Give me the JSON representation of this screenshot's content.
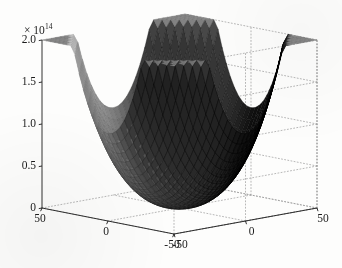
{
  "chart_data": {
    "type": "surface",
    "title": "",
    "xlabel": "",
    "ylabel": "",
    "zlabel": "",
    "exponent_label": "× 10",
    "exponent_value": "14",
    "z_scale": 100000000000000.0,
    "xlim": [
      -50,
      50
    ],
    "ylim": [
      -50,
      50
    ],
    "zlim": [
      0,
      2.0
    ],
    "x_ticks": [
      -50,
      0,
      50
    ],
    "y_ticks": [
      -50,
      0,
      50
    ],
    "z_ticks": [
      0,
      0.5,
      1.0,
      1.5,
      2.0
    ],
    "x_tick_labels": [
      "-50",
      "0",
      "50"
    ],
    "y_tick_labels": [
      "-50",
      "0",
      "50"
    ],
    "z_tick_labels": [
      "0",
      "0.5",
      "1.0",
      "1.5",
      "2.0"
    ],
    "grid": true,
    "legend": false,
    "colormap": "gray",
    "mesh_n": 33,
    "surface_form": "bowl_quartic_product",
    "view": {
      "azimuth": -37.5,
      "elevation": 22
    },
    "corner_value": 2.0,
    "center_value": 0.0,
    "series": [
      {
        "name": "surface",
        "z_at_corners": [
          2.0,
          2.0,
          2.0,
          2.0
        ],
        "z_at_center": 0.0
      }
    ]
  },
  "figure": {
    "background_color": "#fdfdfc",
    "axis_color": "#1b1b1b",
    "grid_color": "#9a9a9a",
    "surface_dark": "#0a0a0a",
    "surface_light": "#dcdcdc"
  }
}
